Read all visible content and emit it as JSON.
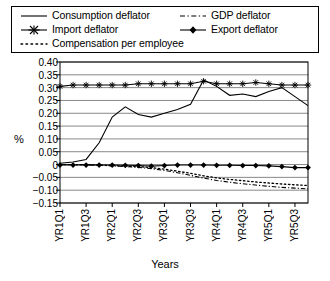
{
  "chart_data": {
    "type": "line",
    "title": "",
    "xlabel": "Years",
    "ylabel": "%",
    "ylim": [
      -0.15,
      0.4
    ],
    "ytick_labels": [
      "0.40",
      "0.35",
      "0.30",
      "0.25",
      "0.20",
      "0.15",
      "0.10",
      "0.05",
      "0",
      "−0.05",
      "−0.10",
      "−0.15"
    ],
    "ytick_values": [
      0.4,
      0.35,
      0.3,
      0.25,
      0.2,
      0.15,
      0.1,
      0.05,
      0,
      -0.05,
      -0.1,
      -0.15
    ],
    "grid": true,
    "legend_position": "top",
    "x": [
      "YR1Q1",
      "YR1Q2",
      "YR1Q3",
      "YR1Q4",
      "YR2Q1",
      "YR2Q2",
      "YR2Q3",
      "YR2Q4",
      "YR3Q1",
      "YR3Q2",
      "YR3Q3",
      "YR3Q4",
      "YR4Q1",
      "YR4Q2",
      "YR4Q3",
      "YR4Q4",
      "YR5Q1",
      "YR5Q2",
      "YR5Q3",
      "YR5Q4"
    ],
    "xtick_labels": [
      "YR1Q1",
      "YR1Q3",
      "YR2Q1",
      "YR2Q3",
      "YR3Q1",
      "YR3Q3",
      "YR4Q1",
      "YR4Q3",
      "YR5Q1",
      "YR5Q3"
    ],
    "xtick_indices": [
      0,
      2,
      4,
      6,
      8,
      10,
      12,
      14,
      16,
      18
    ],
    "series": [
      {
        "name": "Consumption deflator",
        "style": "solid",
        "marker": "none",
        "color": "#000000",
        "values": [
          0.005,
          0.01,
          0.02,
          0.085,
          0.185,
          0.225,
          0.195,
          0.185,
          0.2,
          0.215,
          0.235,
          0.33,
          0.305,
          0.27,
          0.275,
          0.265,
          0.285,
          0.3,
          0.265,
          0.23
        ]
      },
      {
        "name": "Import deflator",
        "style": "solid",
        "marker": "asterisk",
        "color": "#000000",
        "values": [
          0.305,
          0.31,
          0.31,
          0.31,
          0.31,
          0.31,
          0.315,
          0.315,
          0.315,
          0.315,
          0.315,
          0.325,
          0.315,
          0.315,
          0.315,
          0.32,
          0.315,
          0.31,
          0.31,
          0.31
        ]
      },
      {
        "name": "Compensation per employee",
        "style": "dotted",
        "marker": "none",
        "color": "#000000",
        "values": [
          0.0,
          0.0,
          0.0,
          -0.002,
          -0.004,
          -0.006,
          -0.008,
          -0.012,
          -0.018,
          -0.026,
          -0.034,
          -0.044,
          -0.052,
          -0.058,
          -0.063,
          -0.068,
          -0.072,
          -0.076,
          -0.079,
          -0.082
        ]
      },
      {
        "name": "GDP deflator",
        "style": "dashdot",
        "marker": "none",
        "color": "#000000",
        "values": [
          0.0,
          0.0,
          -0.001,
          -0.003,
          -0.005,
          -0.008,
          -0.011,
          -0.016,
          -0.023,
          -0.032,
          -0.042,
          -0.053,
          -0.062,
          -0.069,
          -0.075,
          -0.08,
          -0.085,
          -0.089,
          -0.092,
          -0.095
        ]
      },
      {
        "name": "Export deflator",
        "style": "solid",
        "marker": "diamond",
        "color": "#000000",
        "values": [
          -0.002,
          -0.002,
          -0.002,
          -0.002,
          -0.002,
          -0.003,
          -0.004,
          -0.006,
          -0.004,
          -0.002,
          -0.002,
          -0.002,
          -0.003,
          -0.003,
          -0.004,
          -0.004,
          -0.005,
          -0.008,
          -0.012,
          -0.012
        ]
      }
    ]
  },
  "legend": {
    "items": [
      {
        "label": "Consumption deflator"
      },
      {
        "label": "Import deflator"
      },
      {
        "label": "Compensation per employee"
      },
      {
        "label": "GDP deflator"
      },
      {
        "label": "Export deflator"
      }
    ]
  },
  "axis": {
    "y_title": "%",
    "x_title": "Years"
  }
}
